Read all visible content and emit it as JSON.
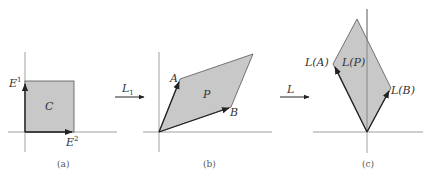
{
  "colors": {
    "fill": "#c8c8c8",
    "stroke": "#222222",
    "axis": "#888888",
    "text": "#333333"
  },
  "panels": [
    {
      "id": "a",
      "caption": "(a)",
      "region_label": "C",
      "vector_labels": {
        "vertical": "E",
        "vertical_sup": "1",
        "horizontal": "E",
        "horizontal_sup": "2"
      }
    },
    {
      "id": "b",
      "caption": "(b)",
      "region_label": "P",
      "vector_labels": {
        "A": "A",
        "B": "B"
      }
    },
    {
      "id": "c",
      "caption": "(c)",
      "region_label": "L(P)",
      "vector_labels": {
        "A": "L(A)",
        "B": "L(B)"
      }
    }
  ],
  "maps": [
    {
      "label": "L",
      "sub": "1",
      "from": "a",
      "to": "b"
    },
    {
      "label": "L",
      "sub": "",
      "from": "b",
      "to": "c"
    }
  ]
}
